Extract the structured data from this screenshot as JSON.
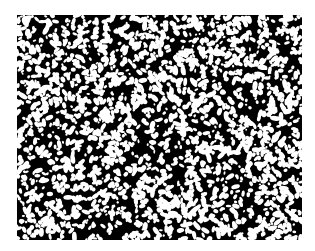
{
  "image": {
    "description": "Binary micrograph-like texture: black field densely speckled with irregular white blobs",
    "background_color": "#ffffff",
    "field_color": "#000000",
    "speckle_color": "#ffffff",
    "field_bounds": {
      "x": 17,
      "y": 15,
      "width": 285,
      "height": 225
    },
    "texture": {
      "seed": 1337,
      "blob_count": 2600,
      "min_radius": 0.9,
      "max_radius": 2.6,
      "elongation": 2.2
    }
  }
}
